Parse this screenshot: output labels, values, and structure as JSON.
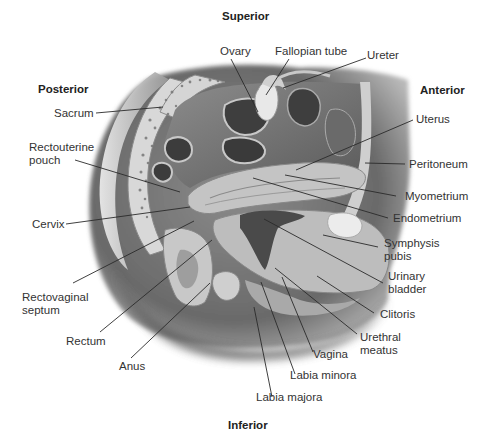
{
  "diagram": {
    "orientation": {
      "superior": "Superior",
      "inferior": "Inferior",
      "anterior": "Anterior",
      "posterior": "Posterior"
    },
    "labels": {
      "ovary": "Ovary",
      "fallopian_tube": "Fallopian tube",
      "ureter": "Ureter",
      "sacrum": "Sacrum",
      "uterus": "Uterus",
      "rectouterine_pouch": "Rectouterine\npouch",
      "peritoneum": "Peritoneum",
      "myometrium": "Myometrium",
      "endometrium": "Endometrium",
      "cervix": "Cervix",
      "symphysis_pubis": "Symphysis\npubis",
      "urinary_bladder": "Urinary\nbladder",
      "rectovaginal_septum": "Rectovaginal\nseptum",
      "clitoris": "Clitoris",
      "rectum": "Rectum",
      "urethral_meatus": "Urethral\nmeatus",
      "anus": "Anus",
      "vagina": "Vagina",
      "labia_minora": "Labia minora",
      "labia_majora": "Labia majora"
    },
    "colors": {
      "background": "#ffffff",
      "text": "#333333",
      "leader_line": "#2a2a2a",
      "body_shadow": "#6e6e6e",
      "tissue_light": "#cfcfcf",
      "tissue_mid": "#9a9a9a",
      "cavity_dark": "#3c3c3c"
    }
  }
}
